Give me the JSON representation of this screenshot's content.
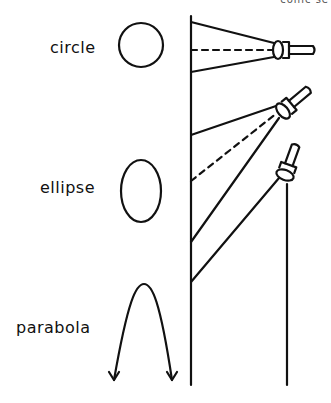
{
  "labels": {
    "circle": "circle",
    "ellipse": "ellipse",
    "parabola": "parabola",
    "clipped_top_text": "conic se"
  },
  "colors": {
    "ink": "#111111",
    "background": "#ffffff"
  }
}
